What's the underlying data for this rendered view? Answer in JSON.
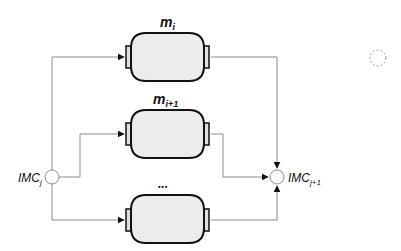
{
  "diagram": {
    "modules": [
      {
        "id": "m_i",
        "label_main": "m",
        "label_sub": "i",
        "y": 32
      },
      {
        "id": "m_i+1",
        "label_main": "m",
        "label_sub": "i+1",
        "y": 110
      },
      {
        "id": "ellipsis",
        "label_main": "...",
        "label_sub": "",
        "y": 195
      }
    ],
    "input_node": {
      "label_main": "IMC",
      "label_sub": "j"
    },
    "output_node": {
      "label_main": "IMC",
      "label_sub": "j+1"
    },
    "colors": {
      "box_fill": "#ececec",
      "box_stroke": "#111111",
      "connector_line": "#8c8c8c",
      "node_stroke": "#8c8c8c",
      "arrow": "#111111",
      "dashed_circle": "#9a9a9a"
    }
  }
}
